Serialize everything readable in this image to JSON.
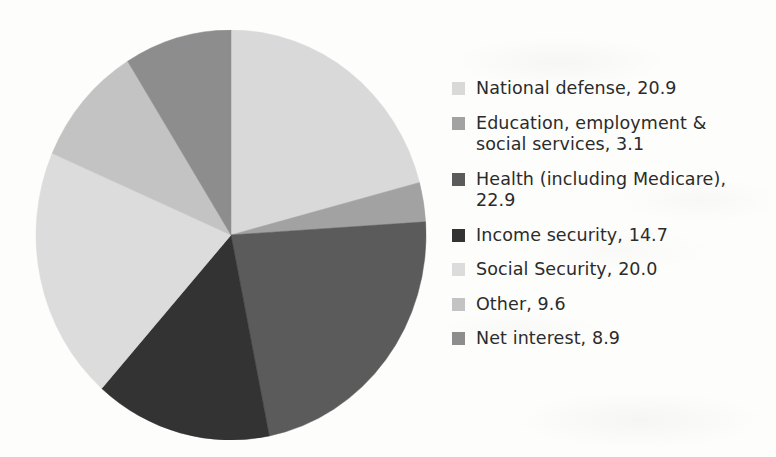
{
  "chart_data": {
    "type": "pie",
    "title": "",
    "subtitle": "",
    "xlabel": "",
    "ylabel": "",
    "value_unit": "percent",
    "grid": false,
    "legend_position": "right",
    "start_angle_deg": 0,
    "direction": "clockwise",
    "categories": [
      "National defense",
      "Education, employment & social services",
      "Health (including Medicare)",
      "Income security",
      "Social Security",
      "Other",
      "Net interest"
    ],
    "values": [
      20.9,
      3.1,
      22.9,
      14.7,
      20.0,
      9.6,
      8.9
    ],
    "total": 100.1,
    "colors": [
      "#d9d9d9",
      "#a2a2a2",
      "#5b5b5b",
      "#333333",
      "#dcdcdc",
      "#c3c3c3",
      "#8d8d8d"
    ],
    "slices": [
      {
        "label": "National defense",
        "value": 20.9,
        "color": "#d9d9d9",
        "legend_text": "National defense, 20.9"
      },
      {
        "label": "Education, employment & social services",
        "value": 3.1,
        "color": "#a2a2a2",
        "legend_text": "Education, employment & social services, 3.1"
      },
      {
        "label": "Health (including Medicare)",
        "value": 22.9,
        "color": "#5b5b5b",
        "legend_text": "Health (including Medicare), 22.9"
      },
      {
        "label": "Income security",
        "value": 14.7,
        "color": "#333333",
        "legend_text": "Income security, 14.7"
      },
      {
        "label": "Social Security",
        "value": 20.0,
        "color": "#dcdcdc",
        "legend_text": "Social Security, 20.0"
      },
      {
        "label": "Other",
        "value": 9.6,
        "color": "#c3c3c3",
        "legend_text": "Other, 9.6"
      },
      {
        "label": "Net interest",
        "value": 8.9,
        "color": "#8d8d8d",
        "legend_text": "Net interest, 8.9"
      }
    ]
  },
  "legend": {
    "items": [
      {
        "text": "National defense, 20.9",
        "color": "#d9d9d9"
      },
      {
        "text": "Education, employment & social services, 3.1",
        "color": "#a2a2a2"
      },
      {
        "text": "Health (including Medicare), 22.9",
        "color": "#5b5b5b"
      },
      {
        "text": "Income security, 14.7",
        "color": "#333333"
      },
      {
        "text": "Social Security, 20.0",
        "color": "#dcdcdc"
      },
      {
        "text": "Other, 9.6",
        "color": "#c3c3c3"
      },
      {
        "text": "Net interest, 8.9",
        "color": "#8d8d8d"
      }
    ]
  },
  "theme": {
    "background": "#fdfdfc",
    "text_color": "#2b2b2b"
  }
}
